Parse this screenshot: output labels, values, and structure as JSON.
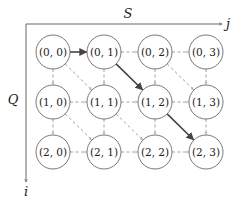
{
  "diagram": {
    "axes": {
      "horizontal_label": "S",
      "horizontal_end_label": "j",
      "vertical_label": "Q",
      "vertical_end_label": "i"
    },
    "grid": {
      "rows": 3,
      "cols": 4
    },
    "nodes": [
      {
        "id": "0-0",
        "label": "(0, 0)",
        "row": 0,
        "col": 0
      },
      {
        "id": "0-1",
        "label": "(0, 1)",
        "row": 0,
        "col": 1
      },
      {
        "id": "0-2",
        "label": "(0, 2)",
        "row": 0,
        "col": 2
      },
      {
        "id": "0-3",
        "label": "(0, 3)",
        "row": 0,
        "col": 3
      },
      {
        "id": "1-0",
        "label": "(1, 0)",
        "row": 1,
        "col": 0
      },
      {
        "id": "1-1",
        "label": "(1, 1)",
        "row": 1,
        "col": 1
      },
      {
        "id": "1-2",
        "label": "(1, 2)",
        "row": 1,
        "col": 2
      },
      {
        "id": "1-3",
        "label": "(1, 3)",
        "row": 1,
        "col": 3
      },
      {
        "id": "2-0",
        "label": "(2, 0)",
        "row": 2,
        "col": 0
      },
      {
        "id": "2-1",
        "label": "(2, 1)",
        "row": 2,
        "col": 1
      },
      {
        "id": "2-2",
        "label": "(2, 2)",
        "row": 2,
        "col": 2
      },
      {
        "id": "2-3",
        "label": "(2, 3)",
        "row": 2,
        "col": 3
      }
    ],
    "edges": [
      {
        "from": "0-0",
        "to": "0-1",
        "style": "bold"
      },
      {
        "from": "0-1",
        "to": "0-2",
        "style": "dashed"
      },
      {
        "from": "0-2",
        "to": "0-3",
        "style": "dashed"
      },
      {
        "from": "1-0",
        "to": "1-1",
        "style": "dashed"
      },
      {
        "from": "1-1",
        "to": "1-2",
        "style": "dashed"
      },
      {
        "from": "1-2",
        "to": "1-3",
        "style": "dashed"
      },
      {
        "from": "2-0",
        "to": "2-1",
        "style": "dashed"
      },
      {
        "from": "2-1",
        "to": "2-2",
        "style": "dashed"
      },
      {
        "from": "2-2",
        "to": "2-3",
        "style": "dashed"
      },
      {
        "from": "0-0",
        "to": "1-0",
        "style": "dashed"
      },
      {
        "from": "0-1",
        "to": "1-1",
        "style": "dashed"
      },
      {
        "from": "0-2",
        "to": "1-2",
        "style": "dashed"
      },
      {
        "from": "0-3",
        "to": "1-3",
        "style": "dashed"
      },
      {
        "from": "1-0",
        "to": "2-0",
        "style": "dashed"
      },
      {
        "from": "1-1",
        "to": "2-1",
        "style": "dashed"
      },
      {
        "from": "1-2",
        "to": "2-2",
        "style": "dashed"
      },
      {
        "from": "1-3",
        "to": "2-3",
        "style": "dashed"
      },
      {
        "from": "0-0",
        "to": "1-1",
        "style": "dashed"
      },
      {
        "from": "0-1",
        "to": "1-2",
        "style": "bold"
      },
      {
        "from": "0-2",
        "to": "1-3",
        "style": "dashed"
      },
      {
        "from": "1-0",
        "to": "2-1",
        "style": "dashed"
      },
      {
        "from": "1-1",
        "to": "2-2",
        "style": "dashed"
      },
      {
        "from": "1-2",
        "to": "2-3",
        "style": "bold"
      }
    ],
    "colors": {
      "node_stroke": "#555555",
      "bold_edge": "#444444",
      "dashed_edge": "#8a8a8a",
      "axis": "#555555",
      "text": "#222222"
    }
  }
}
